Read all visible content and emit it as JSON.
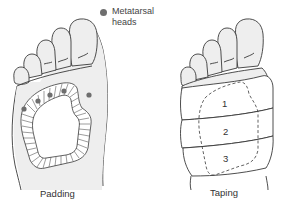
{
  "legend": {
    "line1": "Metatarsal",
    "line2": "heads",
    "marker_color": "#6e6e6e"
  },
  "panels": [
    {
      "id": "padding",
      "caption": "Padding"
    },
    {
      "id": "taping",
      "caption": "Taping"
    }
  ],
  "tape_strips": [
    "1",
    "2",
    "3"
  ],
  "colors": {
    "outline": "#3a3a3a",
    "foot_fill": "#eeeeee",
    "tape_fill": "#ffffff",
    "dot": "#6e6e6e"
  }
}
